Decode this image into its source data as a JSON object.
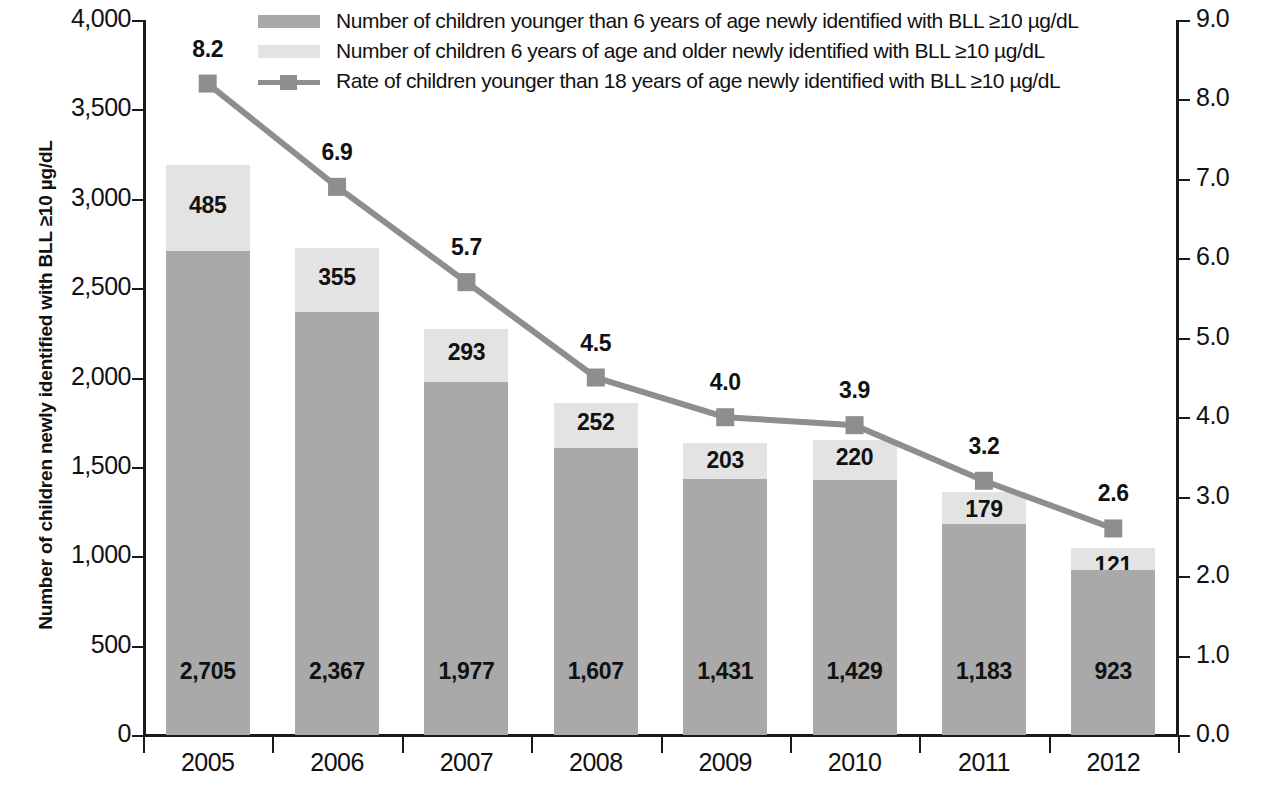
{
  "chart_data": {
    "type": "bar",
    "title": "",
    "subtitle": "",
    "categories": [
      "2005",
      "2006",
      "2007",
      "2008",
      "2009",
      "2010",
      "2011",
      "2012"
    ],
    "xlabel": "",
    "ylabel": "Number of children newly identified with BLL ≥10 µg/dL",
    "ylabel_right": "",
    "ylim": [
      0,
      4000
    ],
    "ylim_right": [
      0,
      9
    ],
    "ytick_labels": [
      "0",
      "500",
      "1,000",
      "1,500",
      "2,000",
      "2,500",
      "3,000",
      "3,500",
      "4,000"
    ],
    "ytick_values": [
      0,
      500,
      1000,
      1500,
      2000,
      2500,
      3000,
      3500,
      4000
    ],
    "ytick_labels_right": [
      "0.0",
      "1.0",
      "2.0",
      "3.0",
      "4.0",
      "5.0",
      "6.0",
      "7.0",
      "8.0",
      "9.0"
    ],
    "ytick_values_right": [
      0,
      1,
      2,
      3,
      4,
      5,
      6,
      7,
      8,
      9
    ],
    "grid": false,
    "legend_position": "top",
    "stacked": true,
    "series": [
      {
        "name": "Number of children  younger than 6 years of age newly identified with BLL ≥10 µg/dL",
        "type": "bar",
        "axis": "left",
        "color": "#a9a9a9",
        "values": [
          2705,
          2367,
          1977,
          1607,
          1431,
          1429,
          1183,
          923
        ],
        "labels": [
          "2,705",
          "2,367",
          "1,977",
          "1,607",
          "1,431",
          "1,429",
          "1,183",
          "923"
        ]
      },
      {
        "name": "Number of children  6 years of age and older newly identified with BLL ≥10 µg/dL",
        "type": "bar",
        "axis": "left",
        "color": "#e3e3e3",
        "values": [
          485,
          355,
          293,
          252,
          203,
          220,
          179,
          121
        ],
        "labels": [
          "485",
          "355",
          "293",
          "252",
          "203",
          "220",
          "179",
          "121"
        ]
      },
      {
        "name": "Rate of children  younger than 18 years of age newly identified with BLL ≥10 µg/dL",
        "type": "line",
        "axis": "right",
        "color": "#8e8e8e",
        "values": [
          8.2,
          6.9,
          5.7,
          4.5,
          4.0,
          3.9,
          3.2,
          2.6
        ],
        "labels": [
          "8.2",
          "6.9",
          "5.7",
          "4.5",
          "4.0",
          "3.9",
          "3.2",
          "2.6"
        ]
      }
    ],
    "totals": [
      3190,
      2722,
      2270,
      1859,
      1634,
      1649,
      1362,
      1044
    ]
  },
  "legend": {
    "items": [
      {
        "swatch": "bar-dark",
        "label": "Number of children  younger than 6 years of age newly identified with BLL ≥10 µg/dL"
      },
      {
        "swatch": "bar-light",
        "label": "Number of children  6 years of age and older newly identified with BLL ≥10 µg/dL"
      },
      {
        "swatch": "line-marker",
        "label": "Rate of children  younger than 18 years of age newly identified with BLL ≥10 µg/dL"
      }
    ]
  },
  "colors": {
    "bar_younger_than_6": "#a9a9a9",
    "bar_6_and_older": "#e3e3e3",
    "rate_line": "#8e8e8e",
    "axis": "#1a1a1a",
    "text": "#111111",
    "background": "#ffffff"
  }
}
